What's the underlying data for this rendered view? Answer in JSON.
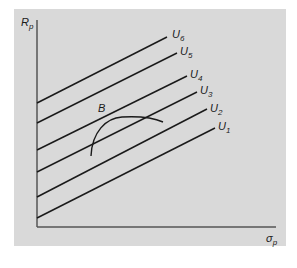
{
  "figure": {
    "background_panel_color": "#d9d9d9",
    "line_color": "#1a1a1a",
    "axis_color": "#555555"
  },
  "axes": {
    "y_label": "R",
    "y_label_sub": "p",
    "x_label": "σ",
    "x_label_sub": "p"
  },
  "indifference_curves": [
    {
      "label": "U",
      "sub": "1",
      "x1": 37,
      "y1": 218,
      "x2": 215,
      "y2": 128,
      "lx": 218,
      "ly": 130
    },
    {
      "label": "U",
      "sub": "2",
      "x1": 37,
      "y1": 197,
      "x2": 207,
      "y2": 109,
      "lx": 210,
      "ly": 112
    },
    {
      "label": "U",
      "sub": "3",
      "x1": 37,
      "y1": 172,
      "x2": 197,
      "y2": 92,
      "lx": 200,
      "ly": 94
    },
    {
      "label": "U",
      "sub": "4",
      "x1": 37,
      "y1": 150,
      "x2": 187,
      "y2": 76,
      "lx": 190,
      "ly": 78
    },
    {
      "label": "U",
      "sub": "5",
      "x1": 37,
      "y1": 123,
      "x2": 177,
      "y2": 53,
      "lx": 180,
      "ly": 55
    },
    {
      "label": "U",
      "sub": "6",
      "x1": 37,
      "y1": 103,
      "x2": 167,
      "y2": 37,
      "lx": 172,
      "ly": 38
    }
  ],
  "frontier": {
    "label": "B",
    "path": "M 91 156 C 92 132, 106 118, 122 117 C 140 116, 154 118, 163 122"
  }
}
